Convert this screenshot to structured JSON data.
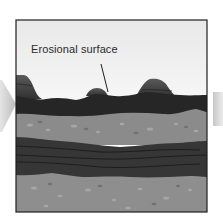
{
  "diagram": {
    "label": "Erosional surface",
    "colors": {
      "sky_top": "#e6e6e6",
      "sky_bottom": "#fbfbfb",
      "hill": "#4a4a4a",
      "dark_layer_top": "#262626",
      "light_layer": "#8b8b8b",
      "dark_layer_mid": "#363636",
      "light_layer_bottom": "#8e8e8e",
      "frame": "#1e1e1e",
      "arrow": "#cfcfcf"
    },
    "layers": [
      {
        "name": "erosional-hills"
      },
      {
        "name": "dark-upper-stratum"
      },
      {
        "name": "light-pebbly-stratum"
      },
      {
        "name": "dark-banded-stratum"
      },
      {
        "name": "light-lower-stratum"
      }
    ]
  }
}
